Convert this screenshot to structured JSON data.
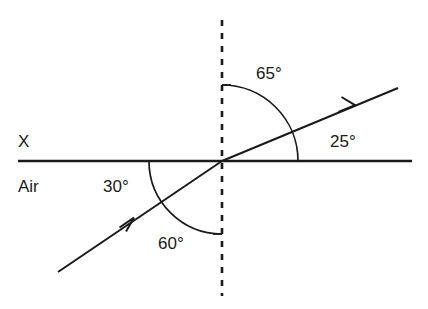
{
  "diagram": {
    "medium_labels": {
      "upper": "X",
      "lower": "Air"
    },
    "angles": {
      "refracted_from_normal": "65°",
      "refracted_from_surface": "25°",
      "incident_from_surface": "30°",
      "incident_from_normal": "60°"
    },
    "colors": {
      "stroke": "#1a1a1a",
      "background": "#ffffff"
    },
    "geometry": {
      "interface_y": 161,
      "normal_x": 222,
      "intersection": "(222, 161)",
      "incident_ray_start": "(58, 272)",
      "refracted_ray_end": "(398, 88)"
    }
  }
}
